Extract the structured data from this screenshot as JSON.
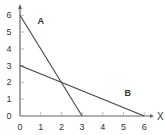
{
  "chart_data": {
    "type": "line",
    "title": "",
    "xlabel": "X",
    "ylabel": "",
    "xlim": [
      0,
      6
    ],
    "ylim": [
      0,
      6
    ],
    "x_ticks": [
      "0",
      "1",
      "2",
      "3",
      "4",
      "5",
      "6"
    ],
    "y_ticks": [
      "0",
      "1",
      "2",
      "3",
      "4",
      "5",
      "6"
    ],
    "grid": false,
    "legend": "none",
    "series": [
      {
        "name": "A",
        "points": [
          [
            0,
            6
          ],
          [
            3,
            0
          ]
        ]
      },
      {
        "name": "B",
        "points": [
          [
            0,
            3
          ],
          [
            6,
            0
          ]
        ]
      }
    ],
    "annotations": [
      {
        "text": "A",
        "x": 1.0,
        "y": 5.5
      },
      {
        "text": "B",
        "x": 5.2,
        "y": 1.2
      }
    ],
    "colors": {
      "axis": "#666666",
      "line": "#444444",
      "text": "#333333"
    }
  }
}
